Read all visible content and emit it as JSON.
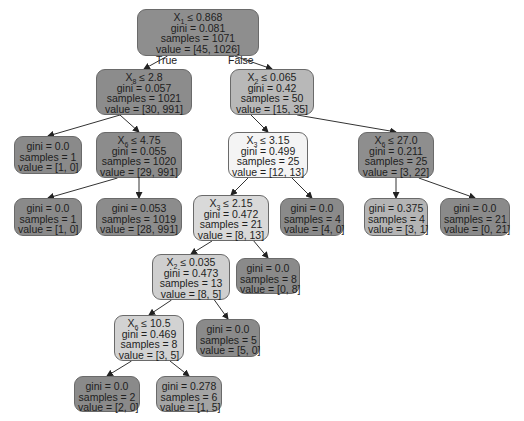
{
  "diagram": {
    "type": "decision-tree",
    "edge_labels": {
      "true": "True",
      "false": "False"
    },
    "nodes": [
      {
        "id": "n0",
        "var": "X",
        "sub": "1",
        "op": "≤",
        "thr": "0.868",
        "gini": "gini = 0.081",
        "samples": "samples = 1071",
        "value": "value = [45, 1026]",
        "x": 137,
        "y": 9,
        "w": 122,
        "h": 47,
        "fill": "#8e8e8e"
      },
      {
        "id": "n1",
        "var": "X",
        "sub": "8",
        "op": "≤",
        "thr": "2.8",
        "gini": "gini = 0.057",
        "samples": "samples = 1021",
        "value": "value = [30, 991]",
        "x": 96,
        "y": 69,
        "w": 96,
        "h": 46,
        "fill": "#8c8c8c"
      },
      {
        "id": "n2",
        "var": "X",
        "sub": "2",
        "op": "≤",
        "thr": "0.065",
        "gini": "gini = 0.42",
        "samples": "samples = 50",
        "value": "value = [15, 35]",
        "x": 230,
        "y": 69,
        "w": 84,
        "h": 46,
        "fill": "#b8b8b8"
      },
      {
        "id": "n3",
        "gini": "gini = 0.0",
        "samples": "samples = 1",
        "value": "value = [1, 0]",
        "x": 14,
        "y": 136,
        "w": 68,
        "h": 38,
        "fill": "#8a8a8a"
      },
      {
        "id": "n4",
        "var": "X",
        "sub": "6",
        "op": "≤",
        "thr": "4.75",
        "gini": "gini = 0.055",
        "samples": "samples = 1020",
        "value": "value = [29, 991]",
        "x": 96,
        "y": 132,
        "w": 86,
        "h": 46,
        "fill": "#8c8c8c"
      },
      {
        "id": "n5",
        "var": "X",
        "sub": "3",
        "op": "≤",
        "thr": "3.15",
        "gini": "gini = 0.499",
        "samples": "samples = 25",
        "value": "value = [12, 13]",
        "x": 228,
        "y": 132,
        "w": 80,
        "h": 46,
        "fill": "#f4f4f4"
      },
      {
        "id": "n6",
        "var": "X",
        "sub": "6",
        "op": "≤",
        "thr": "27.0",
        "gini": "gini = 0.211",
        "samples": "samples = 25",
        "value": "value = [3, 22]",
        "x": 358,
        "y": 132,
        "w": 76,
        "h": 46,
        "fill": "#8e8e8e"
      },
      {
        "id": "n7",
        "gini": "gini = 0.0",
        "samples": "samples = 1",
        "value": "value = [1, 0]",
        "x": 14,
        "y": 198,
        "w": 68,
        "h": 38,
        "fill": "#8a8a8a"
      },
      {
        "id": "n8",
        "gini": "gini = 0.053",
        "samples": "samples = 1019",
        "value": "value = [28, 991]",
        "x": 96,
        "y": 198,
        "w": 86,
        "h": 38,
        "fill": "#8c8c8c"
      },
      {
        "id": "n9",
        "var": "X",
        "sub": "3",
        "op": "≤",
        "thr": "2.15",
        "gini": "gini = 0.472",
        "samples": "samples = 21",
        "value": "value = [8, 13]",
        "x": 193,
        "y": 195,
        "w": 76,
        "h": 46,
        "fill": "#d9d9d9"
      },
      {
        "id": "n10",
        "gini": "gini = 0.0",
        "samples": "samples = 4",
        "value": "value = [4, 0]",
        "x": 280,
        "y": 198,
        "w": 64,
        "h": 38,
        "fill": "#8a8a8a"
      },
      {
        "id": "n11",
        "gini": "gini = 0.375",
        "samples": "samples = 4",
        "value": "value = [3, 1]",
        "x": 364,
        "y": 198,
        "w": 64,
        "h": 38,
        "fill": "#b4b4b4"
      },
      {
        "id": "n12",
        "gini": "gini = 0.0",
        "samples": "samples = 21",
        "value": "value = [0, 21]",
        "x": 440,
        "y": 198,
        "w": 70,
        "h": 38,
        "fill": "#8a8a8a"
      },
      {
        "id": "n13",
        "var": "X",
        "sub": "2",
        "op": "≤",
        "thr": "0.035",
        "gini": "gini = 0.473",
        "samples": "samples = 13",
        "value": "value = [8, 5]",
        "x": 152,
        "y": 254,
        "w": 78,
        "h": 46,
        "fill": "#cfcfcf"
      },
      {
        "id": "n14",
        "gini": "gini = 0.0",
        "samples": "samples = 8",
        "value": "value = [0, 8]",
        "x": 236,
        "y": 258,
        "w": 64,
        "h": 36,
        "fill": "#8a8a8a"
      },
      {
        "id": "n15",
        "var": "X",
        "sub": "6",
        "op": "≤",
        "thr": "10.5",
        "gini": "gini = 0.469",
        "samples": "samples = 8",
        "value": "value = [3, 5]",
        "x": 114,
        "y": 315,
        "w": 70,
        "h": 46,
        "fill": "#d2d2d2"
      },
      {
        "id": "n16",
        "gini": "gini = 0.0",
        "samples": "samples = 5",
        "value": "value = [5, 0]",
        "x": 196,
        "y": 319,
        "w": 64,
        "h": 38,
        "fill": "#8a8a8a"
      },
      {
        "id": "n17",
        "gini": "gini = 0.0",
        "samples": "samples = 2",
        "value": "value = [2, 0]",
        "x": 74,
        "y": 376,
        "w": 66,
        "h": 36,
        "fill": "#8a8a8a"
      },
      {
        "id": "n18",
        "gini": "gini = 0.278",
        "samples": "samples = 6",
        "value": "value = [1, 5]",
        "x": 156,
        "y": 376,
        "w": 66,
        "h": 36,
        "fill": "#a4a4a4"
      }
    ],
    "edges": [
      [
        "n0",
        "n1"
      ],
      [
        "n0",
        "n2"
      ],
      [
        "n1",
        "n3"
      ],
      [
        "n1",
        "n4"
      ],
      [
        "n2",
        "n5"
      ],
      [
        "n2",
        "n6"
      ],
      [
        "n4",
        "n7"
      ],
      [
        "n4",
        "n8"
      ],
      [
        "n5",
        "n9"
      ],
      [
        "n5",
        "n10"
      ],
      [
        "n6",
        "n11"
      ],
      [
        "n6",
        "n12"
      ],
      [
        "n9",
        "n13"
      ],
      [
        "n9",
        "n14"
      ],
      [
        "n13",
        "n15"
      ],
      [
        "n13",
        "n16"
      ],
      [
        "n15",
        "n17"
      ],
      [
        "n15",
        "n18"
      ]
    ]
  }
}
